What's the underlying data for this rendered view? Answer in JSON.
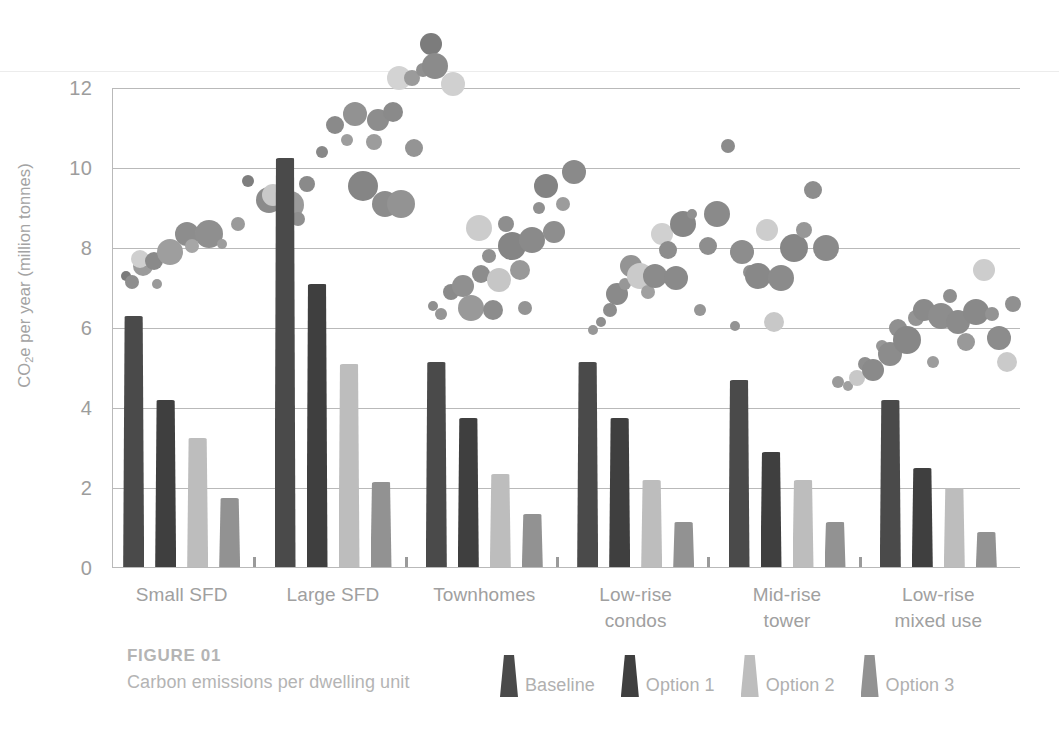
{
  "figure": {
    "number_label": "FIGURE 01",
    "caption": "Carbon emissions per dwelling unit"
  },
  "chart_data": {
    "type": "bar",
    "title": "Carbon emissions per dwelling unit",
    "xlabel": "",
    "ylabel": "CO2e per year (million tonnes)",
    "ylabel_display": "CO₂e per year (million tonnes)",
    "ylim": [
      0,
      12
    ],
    "yticks": [
      0,
      2,
      4,
      6,
      8,
      10,
      12
    ],
    "ytick_labels": [
      "0",
      "2",
      "4",
      "6",
      "8",
      "10",
      "12"
    ],
    "grid": true,
    "legend_position": "bottom",
    "categories": [
      "Small SFD",
      "Large SFD",
      "Townhomes",
      "Low-rise condos",
      "Mid-rise tower",
      "Low-rise mixed use"
    ],
    "category_lines": [
      [
        "Small SFD"
      ],
      [
        "Large SFD"
      ],
      [
        "Townhomes"
      ],
      [
        "Low-rise",
        "condos"
      ],
      [
        "Mid-rise",
        "tower"
      ],
      [
        "Low-rise",
        "mixed use"
      ]
    ],
    "series": [
      {
        "name": "Baseline",
        "color": "#4a4a4a",
        "values": [
          6.3,
          10.25,
          5.15,
          5.15,
          4.7,
          4.2
        ]
      },
      {
        "name": "Option 1",
        "color": "#3f3f3f",
        "values": [
          4.2,
          7.1,
          3.75,
          3.75,
          2.9,
          2.5
        ]
      },
      {
        "name": "Option 2",
        "color": "#bdbdbd",
        "values": [
          3.25,
          5.1,
          2.35,
          2.2,
          2.2,
          2.0
        ]
      },
      {
        "name": "Option 3",
        "color": "#929292",
        "values": [
          1.75,
          2.15,
          1.35,
          1.15,
          1.15,
          0.9
        ]
      }
    ],
    "overlay": {
      "type": "scatter",
      "description": "decorative grey bubble cloud rising left to right",
      "palette": [
        "#6f6f6f",
        "#858585",
        "#9c9c9c",
        "#b5b5b5",
        "#d0d0d0",
        "#5c5c5c"
      ],
      "points": [
        {
          "x": 0.015,
          "y": 7.3,
          "r": 5,
          "c": "#7b7b7b"
        },
        {
          "x": 0.022,
          "y": 7.15,
          "r": 7,
          "c": "#8e8e8e"
        },
        {
          "x": 0.034,
          "y": 7.55,
          "r": 10,
          "c": "#9b9b9b"
        },
        {
          "x": 0.031,
          "y": 7.72,
          "r": 9,
          "c": "#cfcfcf"
        },
        {
          "x": 0.05,
          "y": 7.1,
          "r": 5,
          "c": "#9a9a9a"
        },
        {
          "x": 0.046,
          "y": 7.68,
          "r": 9,
          "c": "#8a8a8a"
        },
        {
          "x": 0.064,
          "y": 7.9,
          "r": 13,
          "c": "#9e9e9e"
        },
        {
          "x": 0.083,
          "y": 8.35,
          "r": 12,
          "c": "#8d8d8d"
        },
        {
          "x": 0.088,
          "y": 8.05,
          "r": 7,
          "c": "#a6a6a6"
        },
        {
          "x": 0.098,
          "y": 8.38,
          "r": 6,
          "c": "#979797"
        },
        {
          "x": 0.107,
          "y": 8.35,
          "r": 14,
          "c": "#8f8f8f"
        },
        {
          "x": 0.121,
          "y": 8.1,
          "r": 5,
          "c": "#9d9d9d"
        },
        {
          "x": 0.139,
          "y": 8.6,
          "r": 7,
          "c": "#9a9a9a"
        },
        {
          "x": 0.15,
          "y": 9.68,
          "r": 6,
          "c": "#7e7e7e"
        },
        {
          "x": 0.173,
          "y": 9.2,
          "r": 13,
          "c": "#8b8b8b"
        },
        {
          "x": 0.177,
          "y": 9.32,
          "r": 11,
          "c": "#c9c9c9"
        },
        {
          "x": 0.196,
          "y": 9.08,
          "r": 14,
          "c": "#9a9a9a"
        },
        {
          "x": 0.205,
          "y": 8.73,
          "r": 7,
          "c": "#8f8f8f"
        },
        {
          "x": 0.215,
          "y": 9.6,
          "r": 8,
          "c": "#8a8a8a"
        },
        {
          "x": 0.231,
          "y": 10.4,
          "r": 6,
          "c": "#888888"
        },
        {
          "x": 0.246,
          "y": 11.08,
          "r": 9,
          "c": "#8a8a8a"
        },
        {
          "x": 0.259,
          "y": 10.7,
          "r": 6,
          "c": "#9d9d9d"
        },
        {
          "x": 0.268,
          "y": 11.35,
          "r": 12,
          "c": "#929292"
        },
        {
          "x": 0.276,
          "y": 9.55,
          "r": 15,
          "c": "#858585"
        },
        {
          "x": 0.289,
          "y": 10.65,
          "r": 8,
          "c": "#9c9c9c"
        },
        {
          "x": 0.293,
          "y": 11.2,
          "r": 11,
          "c": "#8d8d8d"
        },
        {
          "x": 0.301,
          "y": 9.1,
          "r": 13,
          "c": "#8c8c8c"
        },
        {
          "x": 0.309,
          "y": 11.4,
          "r": 10,
          "c": "#8a8a8a"
        },
        {
          "x": 0.318,
          "y": 9.1,
          "r": 14,
          "c": "#939393"
        },
        {
          "x": 0.316,
          "y": 12.25,
          "r": 12,
          "c": "#d3d3d3"
        },
        {
          "x": 0.33,
          "y": 12.25,
          "r": 8,
          "c": "#9b9b9b"
        },
        {
          "x": 0.333,
          "y": 10.5,
          "r": 9,
          "c": "#949494"
        },
        {
          "x": 0.343,
          "y": 12.45,
          "r": 7,
          "c": "#909090"
        },
        {
          "x": 0.351,
          "y": 13.1,
          "r": 11,
          "c": "#7c7c7c"
        },
        {
          "x": 0.356,
          "y": 12.55,
          "r": 13,
          "c": "#8b8b8b"
        },
        {
          "x": 0.375,
          "y": 12.1,
          "r": 12,
          "c": "#d0d0d0"
        },
        {
          "x": 0.353,
          "y": 6.55,
          "r": 5,
          "c": "#8f8f8f"
        },
        {
          "x": 0.362,
          "y": 6.35,
          "r": 6,
          "c": "#959595"
        },
        {
          "x": 0.373,
          "y": 6.9,
          "r": 8,
          "c": "#8a8a8a"
        },
        {
          "x": 0.387,
          "y": 7.05,
          "r": 11,
          "c": "#909090"
        },
        {
          "x": 0.395,
          "y": 6.5,
          "r": 13,
          "c": "#999999"
        },
        {
          "x": 0.406,
          "y": 7.35,
          "r": 9,
          "c": "#8d8d8d"
        },
        {
          "x": 0.404,
          "y": 8.5,
          "r": 13,
          "c": "#cccccc"
        },
        {
          "x": 0.415,
          "y": 7.8,
          "r": 7,
          "c": "#919191"
        },
        {
          "x": 0.42,
          "y": 6.45,
          "r": 10,
          "c": "#8c8c8c"
        },
        {
          "x": 0.426,
          "y": 7.2,
          "r": 12,
          "c": "#c6c6c6"
        },
        {
          "x": 0.434,
          "y": 8.6,
          "r": 8,
          "c": "#8e8e8e"
        },
        {
          "x": 0.441,
          "y": 8.05,
          "r": 14,
          "c": "#858585"
        },
        {
          "x": 0.449,
          "y": 7.45,
          "r": 10,
          "c": "#999999"
        },
        {
          "x": 0.455,
          "y": 6.5,
          "r": 7,
          "c": "#949494"
        },
        {
          "x": 0.463,
          "y": 8.2,
          "r": 13,
          "c": "#8a8a8a"
        },
        {
          "x": 0.47,
          "y": 9.0,
          "r": 6,
          "c": "#909090"
        },
        {
          "x": 0.478,
          "y": 9.55,
          "r": 12,
          "c": "#838383"
        },
        {
          "x": 0.487,
          "y": 8.4,
          "r": 11,
          "c": "#8e8e8e"
        },
        {
          "x": 0.497,
          "y": 9.1,
          "r": 7,
          "c": "#9c9c9c"
        },
        {
          "x": 0.509,
          "y": 9.9,
          "r": 12,
          "c": "#8a8a8a"
        },
        {
          "x": 0.53,
          "y": 5.95,
          "r": 5,
          "c": "#979797"
        },
        {
          "x": 0.539,
          "y": 6.15,
          "r": 5,
          "c": "#8f8f8f"
        },
        {
          "x": 0.548,
          "y": 6.45,
          "r": 7,
          "c": "#8d8d8d"
        },
        {
          "x": 0.556,
          "y": 6.85,
          "r": 11,
          "c": "#8a8a8a"
        },
        {
          "x": 0.565,
          "y": 7.1,
          "r": 6,
          "c": "#979797"
        },
        {
          "x": 0.572,
          "y": 7.55,
          "r": 11,
          "c": "#949494"
        },
        {
          "x": 0.582,
          "y": 7.3,
          "r": 13,
          "c": "#cacaca"
        },
        {
          "x": 0.59,
          "y": 6.9,
          "r": 7,
          "c": "#a0a0a0"
        },
        {
          "x": 0.598,
          "y": 7.3,
          "r": 12,
          "c": "#8b8b8b"
        },
        {
          "x": 0.606,
          "y": 8.35,
          "r": 11,
          "c": "#d0d0d0"
        },
        {
          "x": 0.612,
          "y": 7.95,
          "r": 9,
          "c": "#8d8d8d"
        },
        {
          "x": 0.621,
          "y": 7.25,
          "r": 12,
          "c": "#8a8a8a"
        },
        {
          "x": 0.629,
          "y": 8.6,
          "r": 13,
          "c": "#868686"
        },
        {
          "x": 0.639,
          "y": 8.85,
          "r": 5,
          "c": "#8f8f8f"
        },
        {
          "x": 0.648,
          "y": 6.45,
          "r": 6,
          "c": "#969696"
        },
        {
          "x": 0.656,
          "y": 8.05,
          "r": 9,
          "c": "#8e8e8e"
        },
        {
          "x": 0.666,
          "y": 8.85,
          "r": 13,
          "c": "#8a8a8a"
        },
        {
          "x": 0.678,
          "y": 10.55,
          "r": 7,
          "c": "#8b8b8b"
        },
        {
          "x": 0.686,
          "y": 6.05,
          "r": 5,
          "c": "#949494"
        },
        {
          "x": 0.694,
          "y": 7.9,
          "r": 12,
          "c": "#8d8d8d"
        },
        {
          "x": 0.703,
          "y": 7.4,
          "r": 7,
          "c": "#919191"
        },
        {
          "x": 0.712,
          "y": 7.3,
          "r": 13,
          "c": "#888888"
        },
        {
          "x": 0.721,
          "y": 8.45,
          "r": 11,
          "c": "#cdcdcd"
        },
        {
          "x": 0.729,
          "y": 6.15,
          "r": 10,
          "c": "#c8c8c8"
        },
        {
          "x": 0.737,
          "y": 7.25,
          "r": 13,
          "c": "#8b8b8b"
        },
        {
          "x": 0.751,
          "y": 8.0,
          "r": 14,
          "c": "#868686"
        },
        {
          "x": 0.762,
          "y": 8.45,
          "r": 8,
          "c": "#979797"
        },
        {
          "x": 0.772,
          "y": 9.45,
          "r": 9,
          "c": "#8d8d8d"
        },
        {
          "x": 0.786,
          "y": 8.0,
          "r": 13,
          "c": "#8a8a8a"
        },
        {
          "x": 0.8,
          "y": 4.65,
          "r": 6,
          "c": "#9a9a9a"
        },
        {
          "x": 0.811,
          "y": 4.55,
          "r": 5,
          "c": "#a0a0a0"
        },
        {
          "x": 0.82,
          "y": 4.75,
          "r": 8,
          "c": "#c8c8c8"
        },
        {
          "x": 0.829,
          "y": 5.1,
          "r": 7,
          "c": "#8f8f8f"
        },
        {
          "x": 0.838,
          "y": 4.95,
          "r": 11,
          "c": "#8a8a8a"
        },
        {
          "x": 0.848,
          "y": 5.55,
          "r": 6,
          "c": "#979797"
        },
        {
          "x": 0.857,
          "y": 5.35,
          "r": 12,
          "c": "#8c8c8c"
        },
        {
          "x": 0.866,
          "y": 6.0,
          "r": 9,
          "c": "#909090"
        },
        {
          "x": 0.876,
          "y": 5.7,
          "r": 14,
          "c": "#878787"
        },
        {
          "x": 0.885,
          "y": 6.25,
          "r": 8,
          "c": "#949494"
        },
        {
          "x": 0.894,
          "y": 6.45,
          "r": 11,
          "c": "#8a8a8a"
        },
        {
          "x": 0.904,
          "y": 5.15,
          "r": 6,
          "c": "#9c9c9c"
        },
        {
          "x": 0.913,
          "y": 6.3,
          "r": 13,
          "c": "#8d8d8d"
        },
        {
          "x": 0.923,
          "y": 6.8,
          "r": 7,
          "c": "#8f8f8f"
        },
        {
          "x": 0.932,
          "y": 6.15,
          "r": 12,
          "c": "#8b8b8b"
        },
        {
          "x": 0.941,
          "y": 5.65,
          "r": 9,
          "c": "#999999"
        },
        {
          "x": 0.951,
          "y": 6.4,
          "r": 13,
          "c": "#898989"
        },
        {
          "x": 0.96,
          "y": 7.45,
          "r": 11,
          "c": "#cdcdcd"
        },
        {
          "x": 0.969,
          "y": 6.35,
          "r": 7,
          "c": "#939393"
        },
        {
          "x": 0.977,
          "y": 5.75,
          "r": 12,
          "c": "#8c8c8c"
        },
        {
          "x": 0.986,
          "y": 5.15,
          "r": 10,
          "c": "#cacaca"
        },
        {
          "x": 0.992,
          "y": 6.6,
          "r": 8,
          "c": "#909090"
        }
      ]
    }
  },
  "legend": {
    "items": [
      {
        "label": "Baseline",
        "color": "#4a4a4a"
      },
      {
        "label": "Option 1",
        "color": "#3f3f3f"
      },
      {
        "label": "Option 2",
        "color": "#bdbdbd"
      },
      {
        "label": "Option 3",
        "color": "#929292"
      }
    ]
  }
}
